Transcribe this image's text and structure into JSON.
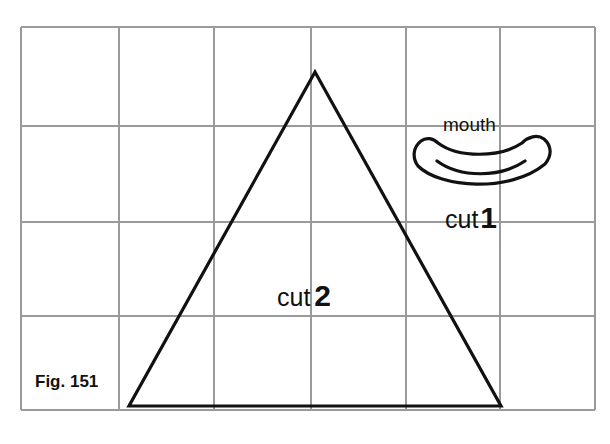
{
  "figure": {
    "caption": "Fig. 151",
    "grid": {
      "columns": 6,
      "rows": 4
    },
    "pieces": [
      {
        "id": "mouth",
        "name": "mouth",
        "cut_word": "cut",
        "cut_count": "1",
        "shape": "crescent"
      },
      {
        "id": "body",
        "name": "",
        "cut_word": "cut",
        "cut_count": "2",
        "shape": "triangle"
      }
    ]
  },
  "colors": {
    "grid": "#9a9a9a",
    "ink": "#111111",
    "background": "#ffffff"
  }
}
